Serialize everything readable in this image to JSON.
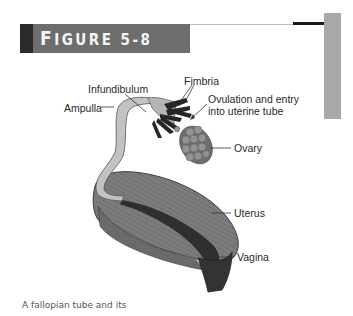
{
  "figure": {
    "title_initial": "F",
    "title_rest": "IGURE 5-8",
    "title_full": "FIGURE 5-8",
    "colors": {
      "banner_dark": "#2b2b2b",
      "banner_box": "#6d6d6d",
      "side_bar": "#a8a8a8",
      "tube_fill": "#b8b8b8",
      "fimbria_fill": "#2a2a2a",
      "ovary_fill": "#8a8a8a",
      "uterus_fill": "#7a7a7a",
      "cavity_fill": "#333333"
    }
  },
  "labels": {
    "infundibulum": "Infundibulum",
    "fimbria": "Fimbria",
    "ampulla": "Ampulla",
    "ovulation_line1": "Ovulation and entry",
    "ovulation_line2": "into uterine tube",
    "ovary": "Ovary",
    "uterus": "Uterus",
    "vagina": "Vagina"
  },
  "caption": "A fallopian tube and its"
}
